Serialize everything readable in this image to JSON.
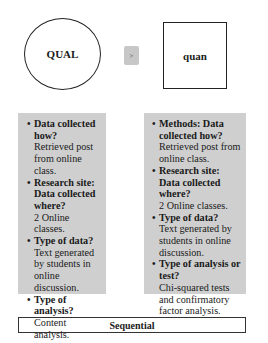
{
  "diagram": {
    "qual_node": {
      "label": "QUAL",
      "shape": "circle"
    },
    "connector": {
      "label": ">"
    },
    "quan_node": {
      "label": "quan",
      "shape": "square"
    },
    "left_panel": {
      "items": [
        {
          "question": "Data collected how?",
          "answer": "Retrieved post from online class."
        },
        {
          "question": "Research site: Data collected where?",
          "answer": "2 Online classes."
        },
        {
          "question": "Type of data?",
          "answer": "Text generated by students in online discussion."
        },
        {
          "question": "Type of analysis?",
          "answer": "Content analysis."
        }
      ]
    },
    "right_panel": {
      "items": [
        {
          "question": "Methods: Data collected how?",
          "answer": "Retrieved post from online class."
        },
        {
          "question": "Research site: Data collected where?",
          "answer": "2 Online classes."
        },
        {
          "question": "Type of data?",
          "answer": "Text generated by students in online discussion."
        },
        {
          "question": "Type of analysis or test?",
          "answer": "Chi-squared tests and confirmatory factor analysis."
        }
      ]
    },
    "design_label": "Sequential",
    "colors": {
      "panel_bg": "#cfcfcf",
      "connector_bg": "#c7c7c7",
      "stroke": "#222222"
    }
  }
}
